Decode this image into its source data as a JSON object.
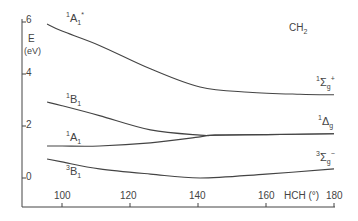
{
  "chart_data": {
    "type": "line",
    "title": "CH2",
    "xlabel": "HCH (°)",
    "ylabel": "E (eV)",
    "xlim": [
      95.6,
      180
    ],
    "ylim": [
      -1.1,
      6
    ],
    "xticks": [
      100,
      120,
      140,
      160,
      180
    ],
    "yticks": [
      0,
      2,
      4,
      6
    ],
    "grid": false,
    "legend": "inline labels",
    "series": [
      {
        "name": "1A1*",
        "label_right": "1Σg+",
        "x": [
          95.6,
          100,
          111,
          126,
          140.6,
          155,
          170,
          180
        ],
        "values": [
          5.92,
          5.65,
          5.1,
          4.2,
          3.5,
          3.3,
          3.22,
          3.2
        ]
      },
      {
        "name": "1B1",
        "label_right": "1Δg",
        "x": [
          95.6,
          100,
          111,
          126,
          140.6,
          145,
          160,
          180
        ],
        "values": [
          2.92,
          2.78,
          2.4,
          1.85,
          1.65,
          1.65,
          1.67,
          1.7
        ]
      },
      {
        "name": "1A1",
        "label_right": "1Δg",
        "x": [
          95.6,
          100,
          111,
          126,
          140.6,
          145,
          160,
          180
        ],
        "values": [
          1.23,
          1.23,
          1.23,
          1.35,
          1.58,
          1.65,
          1.67,
          1.7
        ]
      },
      {
        "name": "3B1",
        "label_right": "3Σg-",
        "x": [
          95.6,
          100,
          111,
          126,
          140.6,
          160,
          180
        ],
        "values": [
          0.73,
          0.62,
          0.35,
          0.15,
          0.0,
          0.15,
          0.35
        ]
      }
    ]
  },
  "labels": {
    "molecule": "CH",
    "molecule_sub": "2",
    "e_label": "E",
    "unit": "(eV)",
    "x_axis": "HCH (°)",
    "ytick_labels": [
      "6",
      "4",
      "2",
      "0"
    ],
    "xtick_labels": [
      "100",
      "120",
      "140",
      "160",
      "180"
    ],
    "left_states": [
      {
        "sup": "1",
        "main": "A",
        "sub": "1",
        "star": "*"
      },
      {
        "sup": "1",
        "main": "B",
        "sub": "1"
      },
      {
        "sup": "1",
        "main": "A",
        "sub": "1"
      },
      {
        "sup": "3",
        "main": "B",
        "sub": "1"
      }
    ],
    "right_states": [
      {
        "sup": "1",
        "main": "Σ",
        "sub": "g",
        "sup2": "+"
      },
      {
        "sup": "1",
        "main": "Δ",
        "sub": "g"
      },
      {
        "sup": "3",
        "main": "Σ",
        "sub": "g",
        "sup2": "−"
      }
    ]
  }
}
